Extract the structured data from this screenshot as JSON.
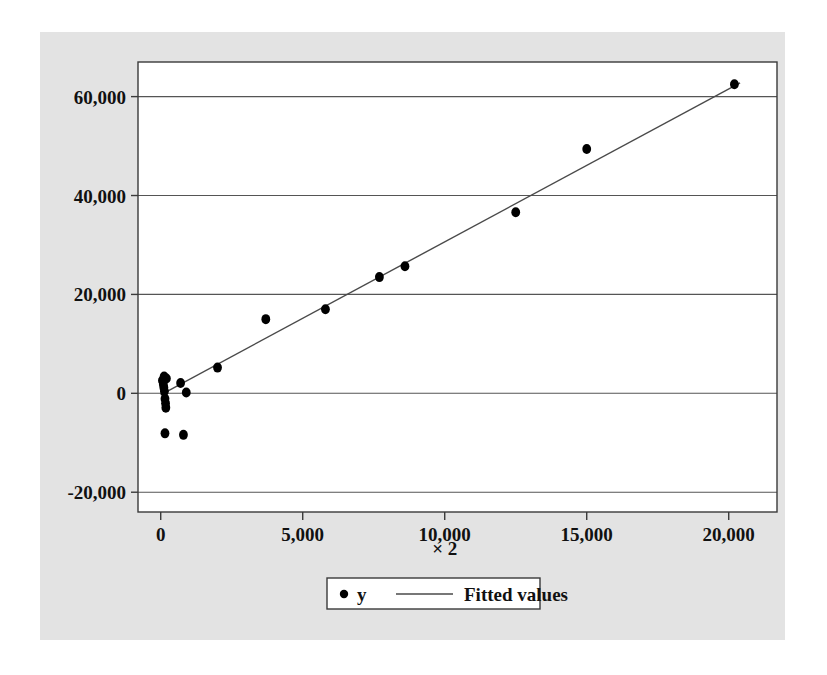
{
  "figure": {
    "background_color": "#e3e3e3",
    "plot_background_color": "#ffffff",
    "frame_color": "#3a3a3a",
    "grid_color": "#555555",
    "marker_color": "#000000",
    "line_color": "#4a4a4a"
  },
  "chart_data": {
    "type": "scatter",
    "title": "",
    "subtitle": "",
    "xlabel": "× 2",
    "ylabel": "",
    "xlim": [
      -800,
      21700
    ],
    "ylim": [
      -24000,
      67000
    ],
    "xticks": [
      0,
      5000,
      10000,
      15000,
      20000
    ],
    "xticklabels": [
      "0",
      "5,000",
      "10,000",
      "15,000",
      "20,000"
    ],
    "yticks": [
      -20000,
      0,
      20000,
      40000,
      60000
    ],
    "yticklabels": [
      "-20,000",
      "0",
      "20,000",
      "40,000",
      "60,000"
    ],
    "grid": "horizontal",
    "legend_position": "below-axis-center",
    "legend": [
      {
        "label": "y",
        "marker": "circle",
        "type": "scatter"
      },
      {
        "label": "Fitted values",
        "marker": "line",
        "type": "line"
      }
    ],
    "series": [
      {
        "name": "y",
        "type": "scatter",
        "points": [
          [
            60,
            2600
          ],
          [
            90,
            1900
          ],
          [
            110,
            1200
          ],
          [
            130,
            400
          ],
          [
            150,
            -1100
          ],
          [
            170,
            -2000
          ],
          [
            180,
            -2900
          ],
          [
            200,
            3000
          ],
          [
            120,
            3400
          ],
          [
            700,
            2100
          ],
          [
            900,
            150
          ],
          [
            150,
            -8100
          ],
          [
            800,
            -8400
          ],
          [
            2000,
            5200
          ],
          [
            3700,
            15000
          ],
          [
            5800,
            17000
          ],
          [
            7700,
            23500
          ],
          [
            8600,
            25700
          ],
          [
            12500,
            36600
          ],
          [
            15000,
            49400
          ],
          [
            20200,
            62500
          ]
        ]
      },
      {
        "name": "Fitted values",
        "type": "line",
        "points": [
          [
            0,
            -300
          ],
          [
            20400,
            62800
          ]
        ]
      }
    ]
  },
  "axis": {
    "xlabel": "× 2"
  },
  "legend": {
    "items": [
      {
        "label": "y"
      },
      {
        "label": "Fitted values"
      }
    ]
  }
}
